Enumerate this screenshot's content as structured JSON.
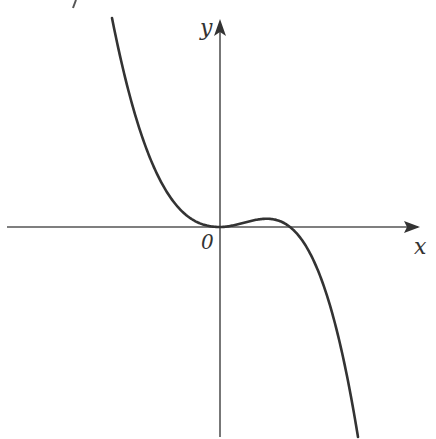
{
  "figure": {
    "type": "function-graph",
    "axes": {
      "x_label": "x",
      "y_label": "y",
      "origin_label": "0"
    },
    "colors": {
      "axis": "#555555",
      "curve": "#333333",
      "background": "#ffffff"
    },
    "corner_mark": "ʼ"
  },
  "chart_data": {
    "type": "line",
    "title": "",
    "xlabel": "x",
    "ylabel": "y",
    "function": "y = -a·x²·(x - r), a > 0, r > 0",
    "features": {
      "double_root": 0,
      "single_root": "r (positive)",
      "local_min": [
        0,
        0
      ],
      "local_max": [
        "2r/3",
        "small positive"
      ]
    },
    "grid": false,
    "legend": null
  }
}
